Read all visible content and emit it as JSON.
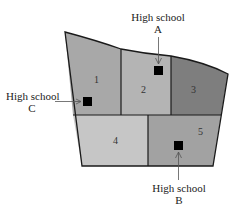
{
  "diagram": {
    "type": "district-map",
    "colors": {
      "outline": "#1a1a1a",
      "zone1": "#a8a8a8",
      "zone2": "#b4b4b4",
      "zone3": "#7e7e7e",
      "zone4": "#c6c6c6",
      "zone5": "#a2a2a2",
      "school_marker": "#000000",
      "arrow": "#555555"
    },
    "zones": [
      {
        "id": "1",
        "label": "1"
      },
      {
        "id": "2",
        "label": "2"
      },
      {
        "id": "3",
        "label": "3"
      },
      {
        "id": "4",
        "label": "4"
      },
      {
        "id": "5",
        "label": "5"
      }
    ],
    "schools": [
      {
        "id": "A",
        "title": "High school",
        "letter": "A",
        "zone": "2"
      },
      {
        "id": "B",
        "title": "High school",
        "letter": "B",
        "zone": "5"
      },
      {
        "id": "C",
        "title": "High school",
        "letter": "C",
        "zone": "1"
      }
    ]
  }
}
